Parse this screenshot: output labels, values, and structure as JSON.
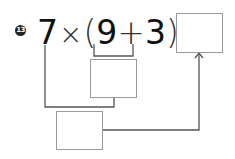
{
  "problem": {
    "number": "13",
    "expression": {
      "a": "7",
      "times": "×",
      "lparen": "(",
      "b": "9",
      "plus": "+",
      "c": "3",
      "rparen": ")",
      "equals": "="
    },
    "boxes": {
      "sum_result": "",
      "product_result": "",
      "final_answer": ""
    }
  }
}
